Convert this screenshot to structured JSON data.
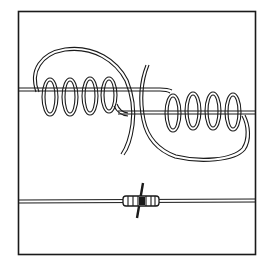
{
  "figure": {
    "colors": {
      "ink": "#1a1a1a",
      "paper": "#ffffff"
    },
    "panels": [
      {
        "name": "loose-splice",
        "coils_left": 4,
        "coils_right": 4
      },
      {
        "name": "finished-splice",
        "wraps": 6
      }
    ]
  }
}
